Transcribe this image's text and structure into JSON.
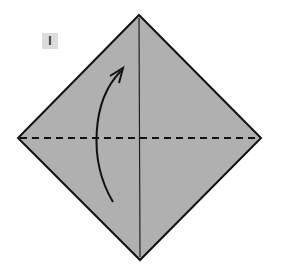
{
  "diagram": {
    "step": {
      "number_label": "I",
      "badge_color": "#dcdcdc",
      "text_color": "#333333"
    },
    "paper": {
      "shape": "square-rotated-45",
      "fill": "#b0b0b0",
      "stroke": "#111111",
      "corners": {
        "top": [
          139,
          15
        ],
        "right": [
          261,
          138
        ],
        "bottom": [
          140,
          260
        ],
        "left": [
          18,
          138
        ]
      }
    },
    "creases": [
      {
        "type": "valley-fold-dashed",
        "orientation": "horizontal",
        "from": [
          18,
          138
        ],
        "to": [
          261,
          138
        ]
      },
      {
        "type": "existing-crease-solid",
        "orientation": "vertical",
        "from": [
          139,
          15
        ],
        "to": [
          140,
          260
        ]
      }
    ],
    "arrow": {
      "meaning": "fold bottom corner up to top",
      "tail": [
        113,
        202
      ],
      "tip": [
        123,
        68
      ]
    }
  }
}
